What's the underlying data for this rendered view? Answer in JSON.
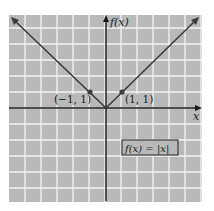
{
  "chart_data": {
    "type": "line",
    "title": "",
    "function_label": "f(x) = |x|",
    "xlabel": "x",
    "ylabel": "f(x)",
    "xlim": [
      -6,
      6
    ],
    "ylim": [
      -5.8,
      5.8
    ],
    "grid": true,
    "grid_step": 1,
    "series": [
      {
        "name": "f(x) = |x|",
        "x": [
          -6,
          0,
          6
        ],
        "y": [
          6,
          0,
          6
        ]
      }
    ],
    "points": [
      {
        "x": -1,
        "y": 1,
        "label": "(−1, 1)"
      },
      {
        "x": 1,
        "y": 1,
        "label": "(1, 1)"
      }
    ],
    "colors": {
      "background": "#b9b9b9",
      "grid": "#f4f4f4",
      "line": "#3c3c3c",
      "axis": "#1a1a1a"
    }
  }
}
